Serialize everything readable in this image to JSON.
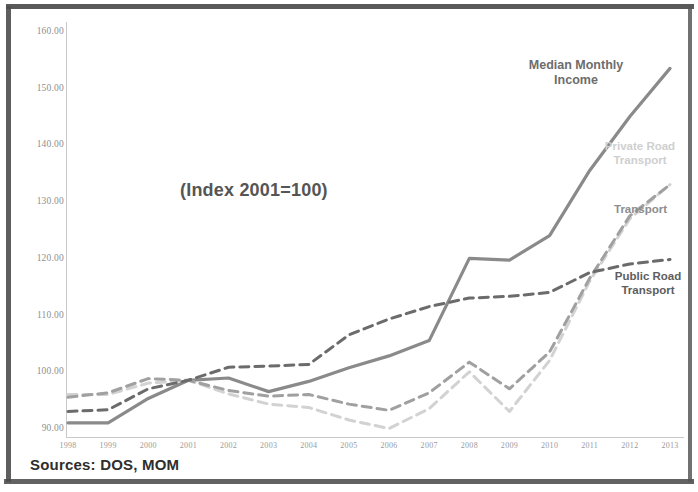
{
  "annotations": {
    "index_note": "(Index 2001=100)",
    "sources": "Sources: DOS, MOM",
    "label_median_line1": "Median Monthly",
    "label_median_line2": "Income",
    "label_private_line1": "Private Road",
    "label_private_line2": "Transport",
    "label_transport": "Transport",
    "label_public_line1": "Public Road",
    "label_public_line2": "Transport"
  },
  "colors": {
    "median_monthly_income": "#8a8a8a",
    "private_road_transport": "#d2d2d2",
    "transport": "#a0a0a0",
    "public_road_transport": "#6b6b6b",
    "axis": "#c8c8c8",
    "tick_text": "#9a9a9a",
    "frame": "#4c4c4c",
    "background": "#ffffff"
  },
  "chart_data": {
    "type": "line",
    "title": "",
    "subtitle": "(Index 2001=100)",
    "xlabel": "",
    "ylabel": "",
    "ylim": [
      90,
      160
    ],
    "yticks": [
      "90.00",
      "100.00",
      "110.00",
      "120.00",
      "130.00",
      "140.00",
      "150.00",
      "160.00"
    ],
    "ytick_values": [
      90,
      100,
      110,
      120,
      130,
      140,
      150,
      160
    ],
    "grid": false,
    "legend": "inline-labels",
    "x": [
      "1998",
      "1999",
      "2000",
      "2001",
      "2002",
      "2003",
      "2004",
      "2005",
      "2006",
      "2007",
      "2008",
      "2009",
      "2010",
      "2011",
      "2012",
      "2013"
    ],
    "categories": [
      "1998",
      "1999",
      "2000",
      "2001",
      "2002",
      "2003",
      "2004",
      "2005",
      "2006",
      "2007",
      "2008",
      "2009",
      "2010",
      "2011",
      "2012",
      "2013"
    ],
    "series": [
      {
        "name": "Median Monthly Income",
        "style": "solid",
        "color": "#8a8a8a",
        "values": [
          92.5,
          92.5,
          96.8,
          100.0,
          100.4,
          98.0,
          99.8,
          102.2,
          104.3,
          107.0,
          121.5,
          121.2,
          125.5,
          137.0,
          146.5,
          155.0
        ]
      },
      {
        "name": "Private Road Transport",
        "style": "dashed",
        "color": "#d2d2d2",
        "values": [
          97.5,
          97.5,
          99.5,
          100.0,
          97.6,
          95.8,
          95.2,
          93.0,
          91.5,
          95.0,
          101.5,
          94.5,
          103.5,
          117.5,
          128.5,
          134.5
        ]
      },
      {
        "name": "Transport",
        "style": "dashed",
        "color": "#a0a0a0",
        "values": [
          97.0,
          97.8,
          100.3,
          100.0,
          98.2,
          97.2,
          97.5,
          95.8,
          94.7,
          97.8,
          103.2,
          98.5,
          105.0,
          118.0,
          129.0,
          134.5
        ]
      },
      {
        "name": "Public Road Transport",
        "style": "dashed",
        "color": "#6b6b6b",
        "values": [
          94.5,
          94.8,
          98.5,
          100.0,
          102.3,
          102.5,
          102.8,
          108.0,
          110.8,
          113.0,
          114.5,
          114.8,
          115.5,
          119.0,
          120.5,
          121.3
        ]
      }
    ]
  }
}
